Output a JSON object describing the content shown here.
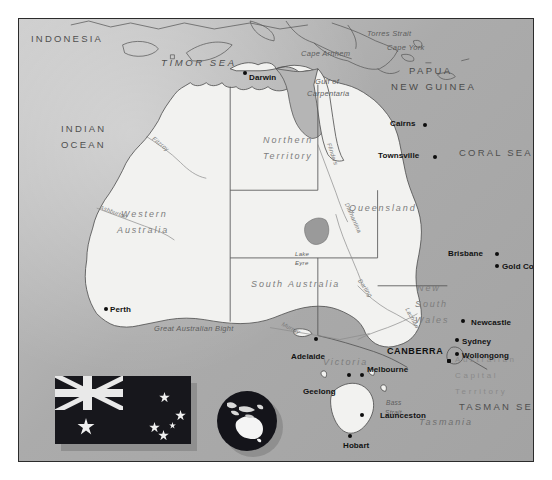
{
  "map": {
    "title": "Australia",
    "colors": {
      "ocean": "#a9a9a9",
      "land": "#f2f2f0",
      "border": "#2b2b2b",
      "city_dot": "#0d0d0d",
      "flag_background": "#17171c",
      "flag_detail": "#e9e9e9",
      "lake": "#9a9a9a"
    },
    "oceans": [
      {
        "name": "INDIAN\nOCEAN",
        "line1": "INDIAN",
        "line2": "OCEAN"
      },
      {
        "name": "TIMOR SEA"
      },
      {
        "name": "CORAL SEA"
      },
      {
        "name": "TASMAN SEA"
      }
    ],
    "countries": [
      {
        "name": "INDONESIA"
      },
      {
        "line1": "PAPUA",
        "line2": "NEW GUINEA"
      }
    ],
    "states": [
      {
        "name": "Western Australia",
        "line1": "Western",
        "line2": "Australia"
      },
      {
        "name": "Northern Territory",
        "line1": "Northern",
        "line2": "Territory"
      },
      {
        "name": "South Australia"
      },
      {
        "name": "Queensland"
      },
      {
        "name": "New South Wales",
        "line1": "New",
        "line2": "South",
        "line3": "Wales"
      },
      {
        "name": "Victoria"
      },
      {
        "name": "Tasmania"
      },
      {
        "name": "Australian Capital Territory",
        "line1": "Australian",
        "line2": "Capital",
        "line3": "Territory"
      }
    ],
    "features": [
      {
        "name": "Torres Strait"
      },
      {
        "name": "Cape York"
      },
      {
        "name": "Cape Arnhem"
      },
      {
        "name": "Gulf of Carpentaria",
        "line1": "Gulf of",
        "line2": "Carpentaria"
      },
      {
        "name": "Great Australian Bight"
      },
      {
        "name": "Bass Strait",
        "line1": "Bass",
        "line2": "Strait"
      },
      {
        "name": "Lake Eyre",
        "line1": "Lake",
        "line2": "Eyre"
      }
    ],
    "rivers": [
      {
        "name": "Fitzroy"
      },
      {
        "name": "Ashburton"
      },
      {
        "name": "Flinders"
      },
      {
        "name": "Diamantina"
      },
      {
        "name": "Darling"
      },
      {
        "name": "Lachlan"
      },
      {
        "name": "Murray"
      }
    ],
    "cities": [
      {
        "name": "Darwin"
      },
      {
        "name": "Cairns"
      },
      {
        "name": "Townsville"
      },
      {
        "name": "Brisbane"
      },
      {
        "name": "Gold Coast"
      },
      {
        "name": "Newcastle"
      },
      {
        "name": "Sydney"
      },
      {
        "name": "Wollongong"
      },
      {
        "name": "CANBERRA",
        "is_capital": true
      },
      {
        "name": "Melbourne"
      },
      {
        "name": "Geelong"
      },
      {
        "name": "Adelaide"
      },
      {
        "name": "Perth"
      },
      {
        "name": "Launceston"
      },
      {
        "name": "Hobart"
      }
    ],
    "insets": [
      {
        "name": "Flag of Australia"
      },
      {
        "name": "Globe locator"
      }
    ]
  }
}
